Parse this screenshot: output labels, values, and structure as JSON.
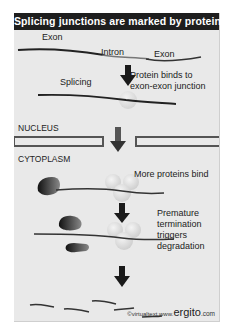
{
  "title": "Splicing junctions are marked by proteins",
  "labels": {
    "exon_left": "Exon",
    "intron": "Intron",
    "exon_right": "Exon",
    "splicing": "Splicing",
    "protein_binds_1": "Protein binds to",
    "protein_binds_2": "exon-exon junction",
    "nucleus": "NUCLEUS",
    "cytoplasm": "CYTOPLASM",
    "more_proteins": "More proteins bind",
    "premature_1": "Premature",
    "premature_2": "termination",
    "premature_3": "triggers",
    "premature_4": "degradation"
  },
  "credit": {
    "virtualtext": "©virtualtext",
    "www": "www.",
    "ergito": "ergito",
    "com": ".com"
  },
  "colors": {
    "title_bg": "#1e1e1e",
    "panel_bg": "#e9e9e9",
    "membrane": "#555555",
    "arrow": "#1a1a1a",
    "protein": "#d8d8d8"
  }
}
